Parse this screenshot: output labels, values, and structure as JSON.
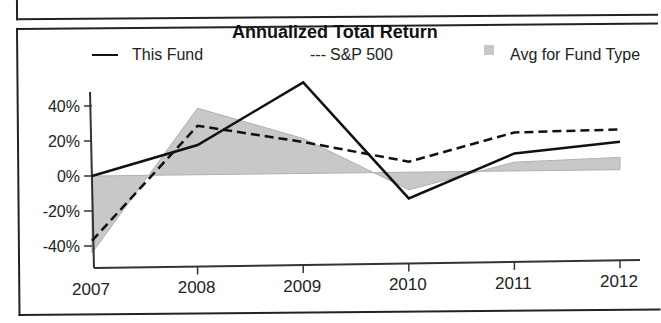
{
  "chart_data": {
    "type": "line",
    "title": "Annualized Total Return",
    "xlabel": "",
    "ylabel": "",
    "categories": [
      "2007",
      "2008",
      "2009",
      "2010",
      "2011",
      "2012"
    ],
    "series": [
      {
        "name": "This Fund",
        "style": "solid",
        "values": [
          0,
          17,
          52,
          -15,
          10,
          16
        ]
      },
      {
        "name": "S&P 500",
        "style": "dashed",
        "values": [
          -37,
          28,
          18,
          6,
          22,
          23
        ]
      },
      {
        "name": "Avg for Fund Type",
        "style": "shaded-area",
        "values": [
          -44,
          38,
          20,
          -10,
          5,
          7
        ]
      }
    ],
    "yticks": [
      "40%",
      "20%",
      "0%",
      "-20%",
      "-40%"
    ],
    "ylim": [
      -50,
      55
    ],
    "grid": false,
    "legend_position": "top"
  },
  "legend": {
    "fund": "This Fund",
    "sp500_prefix": "---",
    "sp500": "S&P 500",
    "avg": "Avg for Fund Type"
  },
  "colors": {
    "line": "#111111",
    "area": "#c8c8c8"
  }
}
